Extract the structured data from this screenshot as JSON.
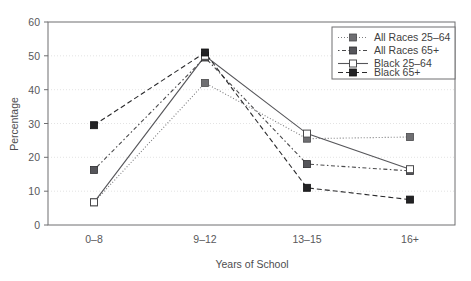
{
  "chart_data": {
    "type": "line",
    "title": "",
    "xlabel": "Years of School",
    "ylabel": "Percentage",
    "categories": [
      "0–8",
      "9–12",
      "13–15",
      "16+"
    ],
    "ylim": [
      0,
      60
    ],
    "yticks": [
      0,
      10,
      20,
      30,
      40,
      50,
      60
    ],
    "ytick_labels": [
      "0",
      "10",
      "20",
      "30",
      "40",
      "50",
      "60"
    ],
    "grid": "horizontal-dotted",
    "legend_position": "top-right",
    "series": [
      {
        "name": "All Races 25–64",
        "values": [
          6.7,
          42.0,
          25.5,
          26.0
        ],
        "line_style": "dotted",
        "marker": "filled-square",
        "color": "#7c7c7e"
      },
      {
        "name": "All Races 65+",
        "values": [
          16.3,
          49.5,
          18.0,
          16.0
        ],
        "line_style": "dash-dot",
        "marker": "filled-square",
        "color": "#4a4a4c"
      },
      {
        "name": "Black 25–64",
        "values": [
          6.7,
          50.0,
          27.0,
          16.5
        ],
        "line_style": "solid",
        "marker": "open-square",
        "color": "#56565a"
      },
      {
        "name": "Black 65+",
        "values": [
          29.5,
          51.0,
          11.0,
          7.5
        ],
        "line_style": "dashed",
        "marker": "filled-square-black",
        "color": "#2a2a2c"
      }
    ]
  },
  "legend": {
    "entries": [
      {
        "label": "All Races 25–64"
      },
      {
        "label": "All Races 65+"
      },
      {
        "label": "Black 25–64"
      },
      {
        "label": "Black 65+"
      }
    ]
  },
  "axes": {
    "y_title": "Percentage",
    "x_title": "Years of School",
    "y_labels": [
      "60",
      "50",
      "40",
      "30",
      "20",
      "10",
      "0"
    ],
    "x_labels": [
      "0–8",
      "9–12",
      "13–15",
      "16+"
    ]
  }
}
